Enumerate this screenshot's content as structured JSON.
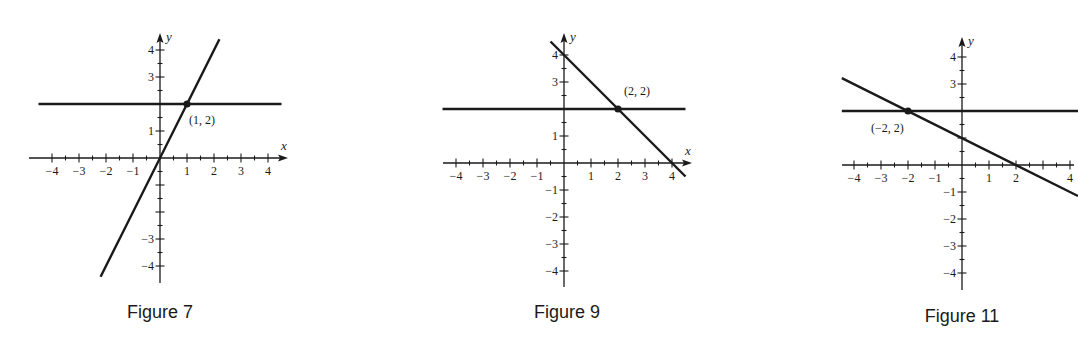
{
  "chart_data": [
    {
      "type": "line",
      "title": "Figure 7",
      "xlabel": "x",
      "ylabel": "y",
      "xlim": [
        -4.5,
        4.5
      ],
      "ylim": [
        -4.5,
        4.5
      ],
      "x_ticks": [
        -4,
        -3,
        -2,
        -1,
        1,
        2,
        3,
        4
      ],
      "y_ticks": [
        -4,
        -3,
        1,
        3,
        4
      ],
      "grid": false,
      "series": [
        {
          "name": "y = 2",
          "equation": "y = 2",
          "x": [
            -4.5,
            4.5
          ],
          "y": [
            2,
            2
          ]
        },
        {
          "name": "y = 2x",
          "equation": "y = 2x",
          "x": [
            -2.2,
            2.2
          ],
          "y": [
            -4.4,
            4.4
          ]
        }
      ],
      "annotations": [
        {
          "point": [
            1,
            2
          ],
          "label": "(1, 2)"
        }
      ]
    },
    {
      "type": "line",
      "title": "Figure 9",
      "xlabel": "x",
      "ylabel": "y",
      "xlim": [
        -4.5,
        4.5
      ],
      "ylim": [
        -4.5,
        4.5
      ],
      "x_ticks": [
        -4,
        -3,
        -2,
        -1,
        1,
        2,
        3,
        4
      ],
      "y_ticks": [
        -4,
        -3,
        -2,
        -1,
        1,
        3,
        4
      ],
      "grid": false,
      "series": [
        {
          "name": "y = 2",
          "equation": "y = 2",
          "x": [
            -4.5,
            4.5
          ],
          "y": [
            2,
            2
          ]
        },
        {
          "name": "y = -x + 4",
          "equation": "y = -x + 4",
          "x": [
            -0.5,
            4.5
          ],
          "y": [
            4.5,
            -0.5
          ]
        }
      ],
      "annotations": [
        {
          "point": [
            2,
            2
          ],
          "label": "(2, 2)"
        }
      ]
    },
    {
      "type": "line",
      "title": "Figure 11",
      "xlabel": "",
      "ylabel": "y",
      "xlim": [
        -4.5,
        4.3
      ],
      "ylim": [
        -4.5,
        4.5
      ],
      "x_ticks": [
        -4,
        -3,
        -2,
        -1,
        1,
        2,
        4
      ],
      "y_ticks": [
        -4,
        -3,
        -2,
        -1,
        3,
        4
      ],
      "grid": false,
      "series": [
        {
          "name": "y = 2",
          "equation": "y = 2",
          "x": [
            -4.4,
            4.3
          ],
          "y": [
            2,
            2
          ]
        },
        {
          "name": "y = -x/2 + 1",
          "equation": "y = -0.5x + 1",
          "x": [
            -4.4,
            4.3
          ],
          "y": [
            3.2,
            -1.15
          ]
        }
      ],
      "annotations": [
        {
          "point": [
            -2,
            2
          ],
          "label": "(−2, 2)"
        }
      ]
    }
  ],
  "figures": [
    {
      "caption": "Figure 7",
      "origin_px": [
        160,
        158
      ],
      "unit_px": 27,
      "x_axis_px": [
        29,
        288
      ],
      "y_axis_px": [
        283,
        33
      ],
      "axis_x_label": "x",
      "axis_y_label": "y",
      "tick_labels_x": [
        {
          "v": -4,
          "t": "−4"
        },
        {
          "v": -3,
          "t": "−3"
        },
        {
          "v": -2,
          "t": "−2"
        },
        {
          "v": -1,
          "t": "−1"
        },
        {
          "v": 1,
          "t": "1"
        },
        {
          "v": 2,
          "t": "2"
        },
        {
          "v": 3,
          "t": "3"
        },
        {
          "v": 4,
          "t": "4"
        }
      ],
      "tick_labels_y": [
        {
          "v": 4,
          "t": "4"
        },
        {
          "v": 3,
          "t": "3"
        },
        {
          "v": 1,
          "t": "1"
        },
        {
          "v": -3,
          "t": "−3"
        },
        {
          "v": -4,
          "t": "−4"
        }
      ],
      "lines": [
        {
          "x1": -4.5,
          "y1": 2,
          "x2": 4.5,
          "y2": 2
        },
        {
          "x1": -2.2,
          "y1": -4.4,
          "x2": 2.2,
          "y2": 4.4
        }
      ],
      "point": {
        "x": 1,
        "y": 2,
        "label": "(1, 2)",
        "label_dx": 2,
        "label_dy": 20
      },
      "caption_px": [
        160,
        322
      ]
    },
    {
      "caption": "Figure 9",
      "origin_px": [
        564,
        163
      ],
      "unit_px": 27,
      "x_axis_px": [
        443,
        692
      ],
      "y_axis_px": [
        287,
        33
      ],
      "axis_x_label": "x",
      "axis_y_label": "y",
      "tick_labels_x": [
        {
          "v": -4,
          "t": "−4"
        },
        {
          "v": -3,
          "t": "−3"
        },
        {
          "v": -2,
          "t": "−2"
        },
        {
          "v": -1,
          "t": "−1"
        },
        {
          "v": 1,
          "t": "1"
        },
        {
          "v": 2,
          "t": "2"
        },
        {
          "v": 3,
          "t": "3"
        },
        {
          "v": 4,
          "t": "4"
        }
      ],
      "tick_labels_y": [
        {
          "v": 4,
          "t": "4"
        },
        {
          "v": 3,
          "t": "3"
        },
        {
          "v": 1,
          "t": "1"
        },
        {
          "v": -1,
          "t": "−1"
        },
        {
          "v": -2,
          "t": "−2"
        },
        {
          "v": -3,
          "t": "−3"
        },
        {
          "v": -4,
          "t": "−4"
        }
      ],
      "lines": [
        {
          "x1": -4.5,
          "y1": 2,
          "x2": 4.5,
          "y2": 2
        },
        {
          "x1": -0.5,
          "y1": 4.5,
          "x2": 4.5,
          "y2": -0.5
        }
      ],
      "point": {
        "x": 2,
        "y": 2,
        "label": "(2, 2)",
        "label_dx": 6,
        "label_dy": -14
      },
      "caption_px": [
        567,
        322
      ]
    },
    {
      "caption": "Figure 11",
      "origin_px": [
        962,
        165
      ],
      "unit_px": 27,
      "x_axis_px": [
        842,
        1078
      ],
      "y_axis_px": [
        290,
        37
      ],
      "axis_x_label": "",
      "axis_y_label": "y",
      "tick_labels_x": [
        {
          "v": -4,
          "t": "−4"
        },
        {
          "v": -3,
          "t": "−3"
        },
        {
          "v": -2,
          "t": "−2"
        },
        {
          "v": -1,
          "t": "−1"
        },
        {
          "v": 1,
          "t": "1"
        },
        {
          "v": 2,
          "t": "2"
        },
        {
          "v": 4,
          "t": "4"
        }
      ],
      "tick_labels_y": [
        {
          "v": 4,
          "t": "4"
        },
        {
          "v": 3,
          "t": "3"
        },
        {
          "v": -1,
          "t": "−1"
        },
        {
          "v": -2,
          "t": "−2"
        },
        {
          "v": -3,
          "t": "−3"
        },
        {
          "v": -4,
          "t": "−4"
        }
      ],
      "lines": [
        {
          "x1": -4.45,
          "y1": 2,
          "x2": 4.3,
          "y2": 2
        },
        {
          "x1": -4.45,
          "y1": 3.22,
          "x2": 4.3,
          "y2": -1.15
        }
      ],
      "point": {
        "x": -2,
        "y": 2,
        "label": "(−2, 2)",
        "label_dx": -37,
        "label_dy": 21
      },
      "caption_px": [
        962,
        326
      ]
    }
  ],
  "colors": {
    "ink": "#1a1a1a",
    "background": "#ffffff"
  }
}
